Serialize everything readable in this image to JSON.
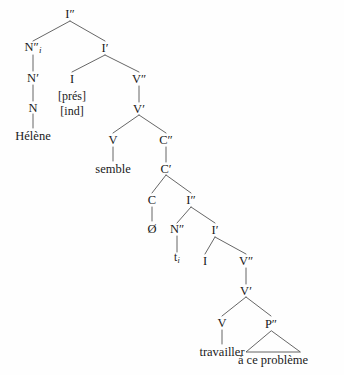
{
  "figure": {
    "type": "x-bar-syntax-tree",
    "language": "French",
    "sentence": "Hélène semble travailler à ce problème",
    "background_color": "#fefefe",
    "line_color": "#555555",
    "text_color": "#1a1a1a"
  },
  "nodes": {
    "root_i2": "I″",
    "subject_n2": "N″",
    "subject_index": "i",
    "subject_n1": "N′",
    "subject_n": "N",
    "subject_word": "Hélène",
    "matrix_i1": "I′",
    "matrix_i": "I",
    "feature_tense": "[prés]",
    "feature_mood": "[ind]",
    "matrix_v2": "V″",
    "matrix_v1": "V′",
    "matrix_v": "V",
    "matrix_verb": "semble",
    "comp_c2": "C″",
    "comp_c1": "C′",
    "comp_c": "C",
    "comp_null": "Ø",
    "embedded_i2": "I″",
    "trace_n2": "N″",
    "trace": "t",
    "trace_index": "i",
    "embedded_i1": "I′",
    "embedded_i": "I",
    "embedded_v2": "V″",
    "embedded_v1": "V′",
    "embedded_v": "V",
    "embedded_verb": "travailler",
    "pp_p2": "P″",
    "pp_phrase": "à ce problème"
  }
}
